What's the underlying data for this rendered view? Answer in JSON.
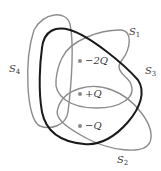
{
  "diagram": {
    "surfaces": [
      {
        "id": "S1",
        "prefix": "S",
        "sub": "1",
        "color": "#8c8c8c"
      },
      {
        "id": "S2",
        "prefix": "S",
        "sub": "2",
        "color": "#8c8c8c"
      },
      {
        "id": "S3",
        "prefix": "S",
        "sub": "3",
        "color": "#1a1a1a"
      },
      {
        "id": "S4",
        "prefix": "S",
        "sub": "4",
        "color": "#8c8c8c"
      }
    ],
    "charges": [
      {
        "label": "−2Q"
      },
      {
        "label": "+Q"
      },
      {
        "label": "−Q"
      }
    ]
  }
}
